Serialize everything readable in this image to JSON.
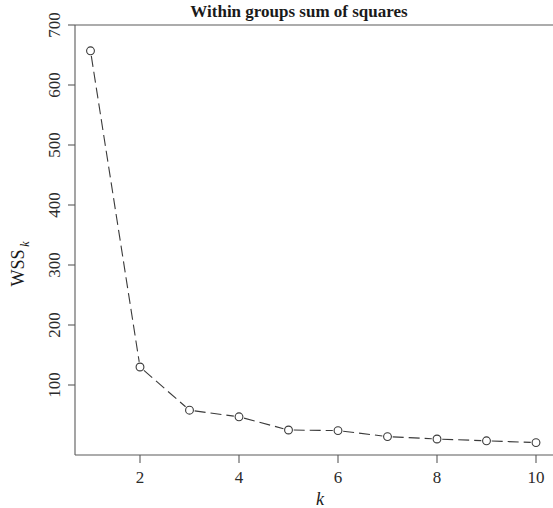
{
  "chart_data": {
    "type": "line",
    "title": "Within groups sum of squares",
    "xlabel": "k",
    "ylabel": "WSS",
    "ylabel_subscript": "k",
    "x": [
      1,
      2,
      3,
      4,
      5,
      6,
      7,
      8,
      9,
      10
    ],
    "values": [
      657,
      130,
      58,
      47,
      25,
      24,
      14,
      10,
      7,
      4
    ],
    "series": [
      {
        "name": "WSS",
        "values": [
          657,
          130,
          58,
          47,
          25,
          24,
          14,
          10,
          7,
          4
        ]
      }
    ],
    "xlim": [
      0.6,
      10.4
    ],
    "ylim": [
      0,
      720
    ],
    "xticks": [
      2,
      4,
      6,
      8,
      10
    ],
    "xtick_labels": [
      "2",
      "4",
      "6",
      "8",
      "10"
    ],
    "yticks": [
      100,
      200,
      300,
      400,
      500,
      600,
      700
    ],
    "ytick_labels": [
      "100",
      "200",
      "300",
      "400",
      "500",
      "600",
      "700"
    ],
    "grid": false,
    "legend": false,
    "marker": "open-circle",
    "line_style": "dashed",
    "line_color": "#3a3a3a",
    "axis_color": "#5a5a5a",
    "background_color": "#ffffff"
  }
}
